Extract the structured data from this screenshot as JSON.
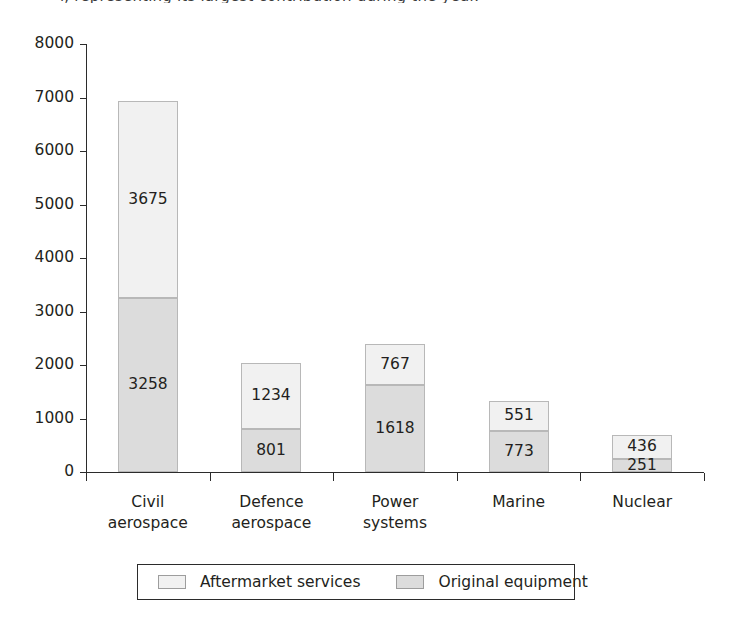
{
  "title_remnant": "l, representing its largest contribution during the year.",
  "chart_data": {
    "type": "bar",
    "stacked": true,
    "title": "",
    "subtitle": "",
    "xlabel": "",
    "ylabel": "",
    "ylim": [
      0,
      8000
    ],
    "ytick_step": 1000,
    "yticks": [
      "8000",
      "7000",
      "6000",
      "5000",
      "4000",
      "3000",
      "2000",
      "1000",
      "0"
    ],
    "grid": false,
    "legend_position": "bottom",
    "categories": [
      {
        "lines": [
          "Civil",
          "aerospace"
        ]
      },
      {
        "lines": [
          "Defence",
          "aerospace"
        ]
      },
      {
        "lines": [
          "Power",
          "systems"
        ]
      },
      {
        "lines": [
          "Marine"
        ]
      },
      {
        "lines": [
          "Nuclear"
        ]
      }
    ],
    "series": [
      {
        "name": "Aftermarket services",
        "color": "#f1f1f1",
        "values": [
          3675,
          1234,
          767,
          551,
          436
        ]
      },
      {
        "name": "Original equipment",
        "color": "#dcdcdc",
        "values": [
          3258,
          801,
          1618,
          773,
          251
        ]
      }
    ],
    "totals": [
      6933,
      2035,
      2385,
      1324,
      687
    ]
  },
  "legend": {
    "items": [
      {
        "label": "Aftermarket services",
        "swatch": "#f1f1f1"
      },
      {
        "label": "Original equipment",
        "swatch": "#dcdcdc"
      }
    ]
  }
}
